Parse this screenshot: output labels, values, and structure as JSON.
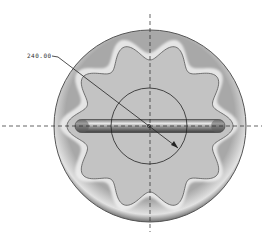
{
  "drawing": {
    "dimension_label": "240.00",
    "dimension_type": "diameter",
    "colors": {
      "background": "#ffffff",
      "disk_face": "#b4b4b4",
      "disk_rim_light": "#ececec",
      "disk_rim_dark": "#6a6a6a",
      "inset_face": "#c2c2c2",
      "bar_dark": "#5a5a5a",
      "bar_highlight": "#e6e6e6",
      "centerline": "#222222",
      "dimension_circle": "#222222"
    },
    "geometry": {
      "center": [
        150,
        126
      ],
      "outer_radius": 96,
      "inner_circle_radius": 38,
      "lobes": 10,
      "bar": {
        "x1": 75,
        "x2": 225,
        "y": 126,
        "thickness": 13
      }
    }
  }
}
